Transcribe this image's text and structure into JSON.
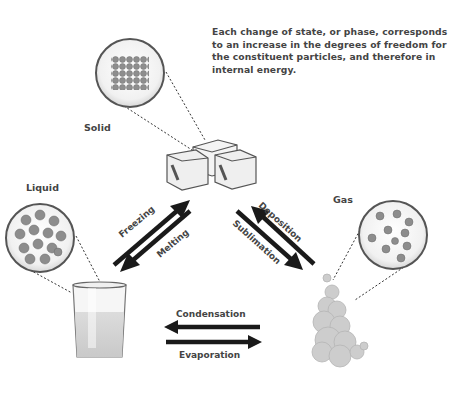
{
  "caption": "Each change of state, or phase, corresponds to an increase in the degrees of freedom for the constituent particles, and therefore in internal energy.",
  "states": {
    "solid": {
      "label": "Solid"
    },
    "liquid": {
      "label": "Liquid"
    },
    "gas": {
      "label": "Gas"
    }
  },
  "transitions": {
    "freezing": "Freezing",
    "melting": "Melting",
    "deposition": "Deposition",
    "sublimation": "Sublimation",
    "condensation": "Condensation",
    "evaporation": "Evaporation"
  },
  "colors": {
    "arrow": "#1a1a1a",
    "text": "#444444",
    "particle": "#8a8a8a",
    "circle_border": "#555555"
  }
}
